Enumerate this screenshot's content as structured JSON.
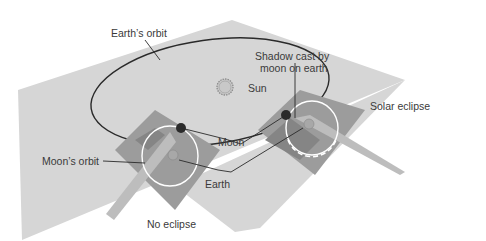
{
  "diagram": {
    "labels": {
      "earth_orbit": "Earth’s orbit",
      "shadow_line1": "Shadow cast by",
      "shadow_line2": "moon on earth",
      "sun": "Sun",
      "solar_eclipse": "Solar eclipse",
      "moon": "Moon",
      "moons_orbit": "Moon’s orbit",
      "earth": "Earth",
      "no_eclipse": "No eclipse"
    },
    "colors": {
      "ecliptic_plane": "#d6d6d6",
      "moon_plane": "#9c9c9c",
      "moon_plane_dark": "#858585",
      "shadow_beam": "#bdbdbd",
      "orbit_line": "#2a2a2a",
      "moon_body": "#2b2b2b",
      "sun_fill": "#c8c8c8",
      "moon_orbit_ring": "#ffffff",
      "text": "#3a3a3a"
    }
  }
}
